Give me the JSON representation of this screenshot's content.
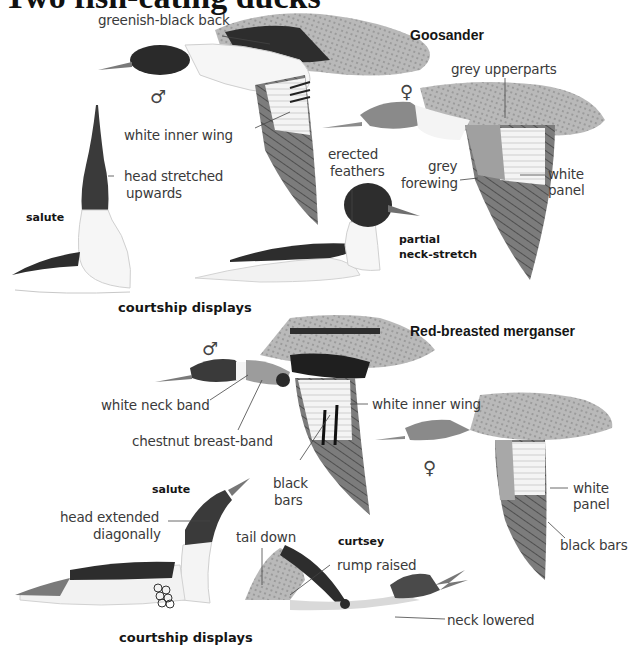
{
  "page": {
    "title": "Two fish-eating ducks"
  },
  "goosander": {
    "species_name": "Goosander",
    "male_symbol": "♂",
    "female_symbol": "♀",
    "labels": {
      "greenish_black_back": "greenish-black back",
      "white_inner_wing": "white inner wing",
      "head_stretched_1": "head stretched",
      "head_stretched_2": "upwards",
      "grey_upperparts": "grey upperparts",
      "grey_forewing_1": "grey",
      "grey_forewing_2": "forewing",
      "white_panel_1": "white",
      "white_panel_2": "panel",
      "erected_feathers_1": "erected",
      "erected_feathers_2": "feathers"
    },
    "displays": {
      "salute": "salute",
      "partial_neck_stretch_1": "partial",
      "partial_neck_stretch_2": "neck-stretch",
      "caption": "courtship displays"
    }
  },
  "merganser": {
    "species_name": "Red-breasted merganser",
    "male_symbol": "♂",
    "female_symbol": "♀",
    "labels": {
      "white_neck_band": "white neck band",
      "chestnut_breast_band": "chestnut breast-band",
      "white_inner_wing": "white inner wing",
      "black_bars_1": "black",
      "black_bars_2": "bars",
      "white_panel_1": "white",
      "white_panel_2": "panel",
      "black_bars_female": "black bars",
      "head_extended_1": "head extended",
      "head_extended_2": "diagonally",
      "tail_down": "tail down",
      "rump_raised": "rump raised",
      "neck_lowered": "neck lowered"
    },
    "displays": {
      "salute": "salute",
      "curtsey": "curtsey",
      "caption": "courtship displays"
    }
  },
  "colors": {
    "ink": "#151515",
    "label_text": "#3a3a3a",
    "dark_head": "#2a2a2a",
    "mid_grey": "#8a8a8a",
    "light_grey": "#b8b8b8",
    "paper": "#ffffff"
  }
}
